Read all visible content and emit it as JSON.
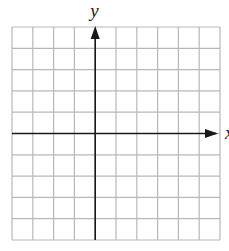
{
  "diagram": {
    "type": "coordinate-grid",
    "grid": {
      "columns": 10,
      "rows": 10,
      "left": 12,
      "top": 27,
      "right": 220,
      "bottom": 240,
      "line_color": "#b8b8b8"
    },
    "axes": {
      "color": "#1a1a1a",
      "y_axis_column": 4,
      "x_axis_row": 5,
      "x_label": "x",
      "y_label": "y"
    }
  }
}
